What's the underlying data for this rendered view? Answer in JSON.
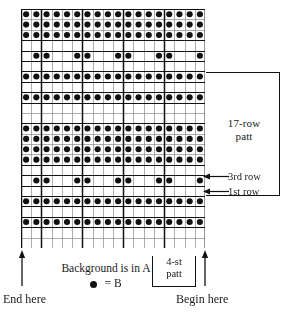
{
  "chart_data": {
    "type": "heatmap",
    "xlabel": "",
    "ylabel": "",
    "columns": 18,
    "rows": 23,
    "legend": [
      {
        "symbol": "dot",
        "label": "B",
        "color": "#111111"
      },
      {
        "symbol": "empty",
        "label": "A (background)",
        "color": "#ffffff"
      }
    ],
    "stitch_repeat": 4,
    "row_repeat": 17,
    "grid": true,
    "cells": [
      [
        1,
        1,
        1,
        1,
        1,
        1,
        1,
        1,
        1,
        1,
        1,
        1,
        1,
        1,
        1,
        1,
        1,
        1
      ],
      [
        1,
        1,
        1,
        1,
        1,
        1,
        1,
        1,
        1,
        1,
        1,
        1,
        1,
        1,
        1,
        1,
        1,
        1
      ],
      [
        1,
        1,
        1,
        1,
        1,
        1,
        1,
        1,
        1,
        1,
        1,
        1,
        1,
        1,
        1,
        1,
        1,
        1
      ],
      [
        0,
        0,
        0,
        0,
        0,
        0,
        0,
        0,
        0,
        0,
        0,
        0,
        0,
        0,
        0,
        0,
        0,
        0
      ],
      [
        0,
        1,
        1,
        0,
        0,
        1,
        1,
        0,
        0,
        1,
        1,
        0,
        0,
        1,
        1,
        0,
        0,
        1
      ],
      [
        0,
        0,
        0,
        0,
        0,
        0,
        0,
        0,
        0,
        0,
        0,
        0,
        0,
        0,
        0,
        0,
        0,
        0
      ],
      [
        1,
        1,
        1,
        1,
        1,
        1,
        1,
        1,
        1,
        1,
        1,
        1,
        1,
        1,
        1,
        1,
        1,
        1
      ],
      [
        0,
        0,
        0,
        0,
        0,
        0,
        0,
        0,
        0,
        0,
        0,
        0,
        0,
        0,
        0,
        0,
        0,
        0
      ],
      [
        1,
        1,
        1,
        1,
        1,
        1,
        1,
        1,
        1,
        1,
        1,
        1,
        1,
        1,
        1,
        1,
        1,
        1
      ],
      [
        0,
        0,
        0,
        0,
        0,
        0,
        0,
        0,
        0,
        0,
        0,
        0,
        0,
        0,
        0,
        0,
        0,
        0
      ],
      [
        0,
        0,
        0,
        0,
        0,
        0,
        0,
        0,
        0,
        0,
        0,
        0,
        0,
        0,
        0,
        0,
        0,
        0
      ],
      [
        1,
        1,
        1,
        1,
        1,
        1,
        1,
        1,
        1,
        1,
        1,
        1,
        1,
        1,
        1,
        1,
        1,
        1
      ],
      [
        1,
        1,
        1,
        1,
        1,
        1,
        1,
        1,
        1,
        1,
        1,
        1,
        1,
        1,
        1,
        1,
        1,
        1
      ],
      [
        1,
        1,
        1,
        1,
        1,
        1,
        1,
        1,
        1,
        1,
        1,
        1,
        1,
        1,
        1,
        1,
        1,
        1
      ],
      [
        1,
        1,
        1,
        1,
        1,
        1,
        1,
        1,
        1,
        1,
        1,
        1,
        1,
        1,
        1,
        1,
        1,
        1
      ],
      [
        0,
        0,
        0,
        0,
        0,
        0,
        0,
        0,
        0,
        0,
        0,
        0,
        0,
        0,
        0,
        0,
        0,
        0
      ],
      [
        0,
        1,
        1,
        0,
        0,
        1,
        1,
        0,
        0,
        1,
        1,
        0,
        0,
        1,
        1,
        0,
        0,
        1
      ],
      [
        0,
        0,
        0,
        0,
        0,
        0,
        0,
        0,
        0,
        0,
        0,
        0,
        0,
        0,
        0,
        0,
        0,
        0
      ],
      [
        1,
        1,
        1,
        1,
        1,
        1,
        1,
        1,
        1,
        1,
        1,
        1,
        1,
        1,
        1,
        1,
        1,
        1
      ],
      [
        0,
        0,
        0,
        0,
        0,
        0,
        0,
        0,
        0,
        0,
        0,
        0,
        0,
        0,
        0,
        0,
        0,
        0
      ],
      [
        1,
        1,
        1,
        1,
        1,
        1,
        1,
        1,
        1,
        1,
        1,
        1,
        1,
        1,
        1,
        1,
        1,
        1
      ],
      [
        0,
        0,
        0,
        0,
        0,
        0,
        0,
        0,
        0,
        0,
        0,
        0,
        0,
        0,
        0,
        0,
        0,
        0
      ],
      [
        0,
        0,
        0,
        0,
        0,
        0,
        0,
        0,
        0,
        0,
        0,
        0,
        0,
        0,
        0,
        0,
        0,
        0
      ]
    ]
  },
  "annotations": {
    "row_patt": {
      "line1": "17-row",
      "line2": "patt"
    },
    "callout_3rd_row": "3rd row",
    "callout_1st_row": "1st row",
    "stitch_patt": {
      "line1": "4-st",
      "line2": "patt"
    },
    "background_note": "Background is in A",
    "legend_equals": "=",
    "legend_b": "B",
    "end_here": "End here",
    "begin_here": "Begin here"
  },
  "colors": {
    "ink": "#111111",
    "paper": "#ffffff",
    "grid_thin": "#8a8a8a",
    "grid_thick": "#111111"
  }
}
